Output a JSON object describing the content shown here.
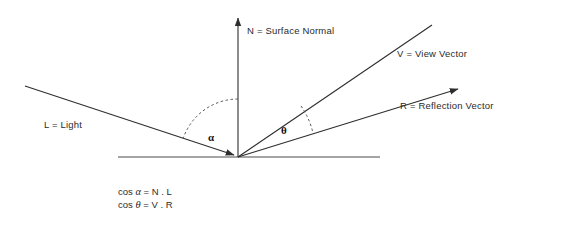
{
  "diagram": {
    "background_color": "#ffffff",
    "line_color": "#3a3a3a",
    "labels": {
      "normal": "N = Surface Normal",
      "view": "V = View Vector",
      "reflection": "R = Reflection Vector",
      "light": "L = Light",
      "alpha": "α",
      "theta": "θ"
    },
    "formulas": {
      "line1_prefix": "cos ",
      "line1_symbol": "α",
      "line1_suffix": " = N . L",
      "line2_prefix": "cos ",
      "line2_symbol": "θ",
      "line2_suffix": " = V . R"
    },
    "geometry": {
      "origin_x": 238,
      "origin_y": 157,
      "ground_line": {
        "x1": 118,
        "y1": 157,
        "x2": 380,
        "y2": 157
      },
      "normal_vector": {
        "x1": 238,
        "y1": 157,
        "x2": 238,
        "y2": 16,
        "arrow": true
      },
      "light_vector": {
        "x1": 25,
        "y1": 86,
        "x2": 238,
        "y2": 157,
        "arrow": true
      },
      "view_vector": {
        "x1": 238,
        "y1": 157,
        "x2": 432,
        "y2": 25,
        "arrow": false
      },
      "reflection_vector": {
        "x1": 238,
        "y1": 157,
        "x2": 462,
        "y2": 87,
        "arrow": true
      },
      "alpha_arc_radius": 58,
      "theta_arc_radius": 78
    }
  }
}
